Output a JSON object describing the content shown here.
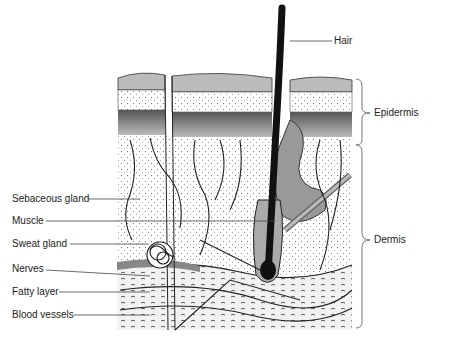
{
  "diagram": {
    "labels_left": [
      {
        "id": "sebaceous-gland",
        "text": "Sebaceous gland",
        "y": 199
      },
      {
        "id": "muscle",
        "text": "Muscle",
        "y": 221
      },
      {
        "id": "sweat-gland",
        "text": "Sweat gland",
        "y": 244
      },
      {
        "id": "nerves",
        "text": "Nerves",
        "y": 269
      },
      {
        "id": "fatty-layer",
        "text": "Fatty layer",
        "y": 292
      },
      {
        "id": "blood-vessels",
        "text": "Blood vessels",
        "y": 315
      }
    ],
    "labels_right": [
      {
        "id": "hair",
        "text": "Hair",
        "y": 41
      },
      {
        "id": "epidermis",
        "text": "Epidermis",
        "y": 113
      },
      {
        "id": "dermis",
        "text": "Dermis",
        "y": 240
      }
    ],
    "colors": {
      "ink": "#1a1a1a",
      "shade": "#8c8c8c",
      "light": "#d9d9d9",
      "line": "#444444"
    }
  }
}
